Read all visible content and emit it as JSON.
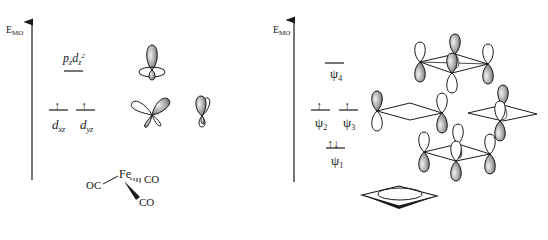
{
  "left_panel": {
    "axis_label": "E",
    "axis_label_sub": "MO",
    "levels": [
      {
        "id": "pz_dz2",
        "label_main": "p",
        "label_sub1": "z",
        "label_mid": "d",
        "label_sub2": "z",
        "label_sup": "2",
        "electrons": ""
      },
      {
        "id": "dxz",
        "label_main": "d",
        "label_sub": "xz",
        "electrons": "↑"
      },
      {
        "id": "dyz",
        "label_main": "d",
        "label_sub": "yz",
        "electrons": "↑"
      }
    ],
    "fragment": {
      "metal": "Fe",
      "ligands": [
        "OC",
        "CO",
        "CO"
      ]
    }
  },
  "right_panel": {
    "axis_label": "E",
    "axis_label_sub": "MO",
    "levels": [
      {
        "id": "psi4",
        "label_main": "ψ",
        "label_sub": "4",
        "electrons": ""
      },
      {
        "id": "psi2",
        "label_main": "ψ",
        "label_sub": "2",
        "electrons": "↑"
      },
      {
        "id": "psi3",
        "label_main": "ψ",
        "label_sub": "3",
        "electrons": "↑"
      },
      {
        "id": "psi1",
        "label_main": "ψ",
        "label_sub": "1",
        "electrons": "↑↓"
      }
    ],
    "fragment": "cyclobutadiene"
  },
  "colors": {
    "ink": "#1a1a1a",
    "lobe_fill": "#8c8c8c",
    "lobe_highlight": "#e6e6e6"
  }
}
